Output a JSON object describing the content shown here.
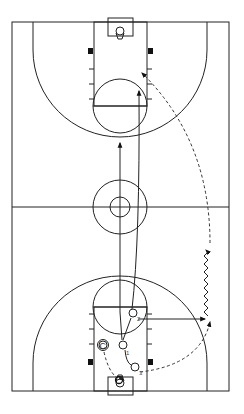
{
  "diagram": {
    "type": "basketball-half-court-drill",
    "colors": {
      "lines": "#222222",
      "background": "#ffffff",
      "block": "#111111"
    },
    "players": [
      {
        "id": "1",
        "label": "1",
        "x": 123,
        "y": 345
      },
      {
        "id": "2",
        "label": "2",
        "x": 133,
        "y": 313
      },
      {
        "id": "3",
        "label": "3",
        "x": 135,
        "y": 367
      }
    ],
    "coach": {
      "label": "C",
      "x": 103,
      "y": 345
    },
    "legend_marks": {
      "cut": "solid arrow",
      "pass": "dashed arrow",
      "dribble": "zigzag line"
    }
  }
}
